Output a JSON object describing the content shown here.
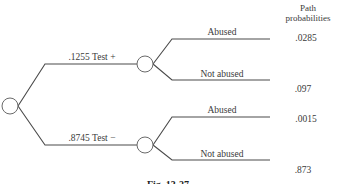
{
  "diagram": {
    "type": "probability-tree",
    "header": {
      "line1": "Path",
      "line2": "probabilities"
    },
    "first_stage": [
      {
        "label": ".1255 Test +",
        "probability": ".1255",
        "outcome": "Test +"
      },
      {
        "label": ".8745 Test −",
        "probability": ".8745",
        "outcome": "Test −"
      }
    ],
    "second_stage": [
      {
        "label": "Abused",
        "path_probability": ".0285"
      },
      {
        "label": "Not abused",
        "path_probability": ".097"
      },
      {
        "label": "Abused",
        "path_probability": ".0015"
      },
      {
        "label": "Not abused",
        "path_probability": ".873"
      }
    ],
    "caption": "Fig. 13-27"
  }
}
